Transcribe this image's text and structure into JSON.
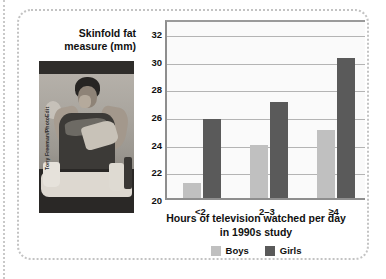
{
  "figure": {
    "photo_credit": "Tony Freeman/PhotoEdit",
    "photo_alt": "photograph-of-person-eating-snacks"
  },
  "chart_data": {
    "type": "bar",
    "title": "",
    "categories": [
      "<2",
      "2–3",
      "≥4"
    ],
    "series": [
      {
        "name": "Boys",
        "color": "#c0c0c0",
        "values": [
          21.1,
          23.8,
          24.9
        ]
      },
      {
        "name": "Girls",
        "color": "#5a5a5a",
        "values": [
          25.7,
          26.9,
          30.1
        ]
      }
    ],
    "ylabel": "Skinfold fat measure (mm)",
    "xlabel": "Hours of television watched per day in 1990s study",
    "xlabel_line1": "Hours of television watched per day",
    "xlabel_line2": "in 1990s study",
    "ylim": [
      20,
      33
    ],
    "yticks": [
      20,
      22,
      24,
      26,
      28,
      30,
      32
    ],
    "ytick_labels": [
      "20",
      "22",
      "24",
      "26",
      "28",
      "30",
      "32"
    ],
    "grid": true,
    "grid_axis": "y",
    "legend_position": "bottom-center",
    "legend": [
      "Boys",
      "Girls"
    ]
  }
}
